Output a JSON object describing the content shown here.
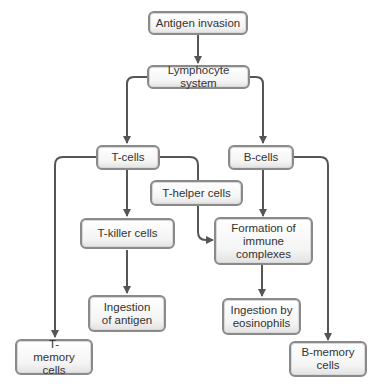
{
  "diagram": {
    "type": "flowchart",
    "nodes": {
      "antigen_invasion": "Antigen invasion",
      "lymphocyte_system": "Lymphocyte system",
      "t_cells": "T-cells",
      "b_cells": "B-cells",
      "t_helper_cells": "T-helper cells",
      "t_killer_cells": "T-killer cells",
      "formation_immune_complexes": "Formation of immune complexes",
      "ingestion_of_antigen": "Ingestion of antigen",
      "ingestion_by_eosinophils": "Ingestion by eosinophils",
      "t_memory_cells": "T-memory cells",
      "b_memory_cells": "B-memory cells"
    },
    "edges": [
      [
        "antigen_invasion",
        "lymphocyte_system"
      ],
      [
        "lymphocyte_system",
        "t_cells"
      ],
      [
        "lymphocyte_system",
        "b_cells"
      ],
      [
        "t_cells",
        "t_killer_cells"
      ],
      [
        "t_cells",
        "t_memory_cells"
      ],
      [
        "t_cells",
        "formation_immune_complexes"
      ],
      [
        "b_cells",
        "formation_immune_complexes"
      ],
      [
        "b_cells",
        "b_memory_cells"
      ],
      [
        "t_killer_cells",
        "ingestion_of_antigen"
      ],
      [
        "formation_immune_complexes",
        "ingestion_by_eosinophils"
      ]
    ],
    "colors": {
      "line": "#555555",
      "border": "#8a8a8a",
      "text": "#333333"
    }
  }
}
